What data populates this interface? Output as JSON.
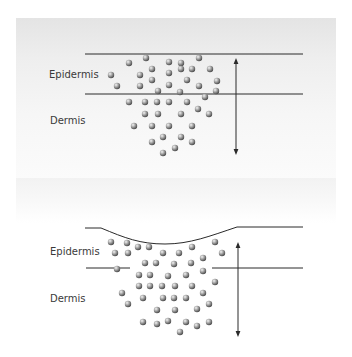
{
  "panels": [
    {
      "id": "normal",
      "labels": {
        "upper": "Epidermis",
        "lower": "Dermis"
      },
      "label_pos": {
        "upper": [
          49,
          69
        ],
        "lower": [
          50,
          115
        ]
      },
      "surface_line": {
        "type": "straight",
        "y": 54,
        "x1": 85,
        "x2": 303
      },
      "boundary_line": {
        "y": 94,
        "segments": [
          [
            85,
            303
          ]
        ]
      },
      "arrow": {
        "x": 236,
        "y1": 58,
        "y2": 155
      },
      "particles": [
        [
          129,
          63
        ],
        [
          146,
          58
        ],
        [
          169,
          62
        ],
        [
          181,
          63
        ],
        [
          199,
          58
        ],
        [
          111,
          75
        ],
        [
          152,
          69
        ],
        [
          140,
          75
        ],
        [
          169,
          73
        ],
        [
          181,
          69
        ],
        [
          192,
          69
        ],
        [
          210,
          69
        ],
        [
          117,
          86
        ],
        [
          140,
          86
        ],
        [
          152,
          80
        ],
        [
          169,
          85
        ],
        [
          187,
          80
        ],
        [
          199,
          86
        ],
        [
          217,
          81
        ],
        [
          158,
          91
        ],
        [
          180,
          92
        ],
        [
          216,
          91
        ],
        [
          205,
          97
        ],
        [
          129,
          102
        ],
        [
          145,
          102
        ],
        [
          157,
          102
        ],
        [
          169,
          102
        ],
        [
          187,
          102
        ],
        [
          145,
          114
        ],
        [
          158,
          114
        ],
        [
          181,
          114
        ],
        [
          198,
          109
        ],
        [
          209,
          114
        ],
        [
          134,
          126
        ],
        [
          152,
          126
        ],
        [
          169,
          126
        ],
        [
          192,
          126
        ],
        [
          163,
          137
        ],
        [
          181,
          137
        ],
        [
          152,
          142
        ],
        [
          192,
          142
        ],
        [
          175,
          148
        ],
        [
          163,
          153
        ]
      ]
    },
    {
      "id": "depressed",
      "labels": {
        "upper": "Epidermis",
        "lower": "Dermis"
      },
      "label_pos": {
        "upper": [
          50,
          246
        ],
        "lower": [
          50,
          293
        ]
      },
      "surface_line": {
        "type": "curve",
        "path": "M85,228 L101,228 C125,238 140,244 165,244 C190,244 210,236 237,227 L303,227"
      },
      "boundary_line": {
        "y": 268,
        "segments": [
          [
            86,
            130
          ],
          [
            212,
            303
          ]
        ]
      },
      "arrow": {
        "x": 238,
        "y1": 242,
        "y2": 337
      },
      "particles": [
        [
          111,
          242
        ],
        [
          127,
          243
        ],
        [
          138,
          247
        ],
        [
          149,
          247
        ],
        [
          163,
          253
        ],
        [
          179,
          253
        ],
        [
          192,
          247
        ],
        [
          215,
          242
        ],
        [
          115,
          253
        ],
        [
          128,
          253
        ],
        [
          222,
          253
        ],
        [
          145,
          263
        ],
        [
          156,
          263
        ],
        [
          174,
          264
        ],
        [
          191,
          263
        ],
        [
          203,
          258
        ],
        [
          117,
          269
        ],
        [
          139,
          275
        ],
        [
          150,
          275
        ],
        [
          168,
          276
        ],
        [
          186,
          275
        ],
        [
          203,
          271
        ],
        [
          139,
          286
        ],
        [
          150,
          286
        ],
        [
          162,
          286
        ],
        [
          175,
          286
        ],
        [
          192,
          286
        ],
        [
          215,
          282
        ],
        [
          122,
          293
        ],
        [
          203,
          293
        ],
        [
          128,
          304
        ],
        [
          143,
          298
        ],
        [
          163,
          298
        ],
        [
          174,
          298
        ],
        [
          186,
          298
        ],
        [
          209,
          304
        ],
        [
          197,
          309
        ],
        [
          157,
          310
        ],
        [
          175,
          310
        ],
        [
          143,
          322
        ],
        [
          157,
          324
        ],
        [
          168,
          321
        ],
        [
          186,
          322
        ],
        [
          197,
          326
        ],
        [
          209,
          322
        ],
        [
          180,
          332
        ]
      ]
    }
  ],
  "colors": {
    "line": "#2a2a2a",
    "label": "#3a3a3a",
    "particle_light": "#f4f4f4",
    "particle_mid": "#a8a8a8",
    "particle_dark": "#4a4a4a"
  },
  "particle_radius": 3.2
}
